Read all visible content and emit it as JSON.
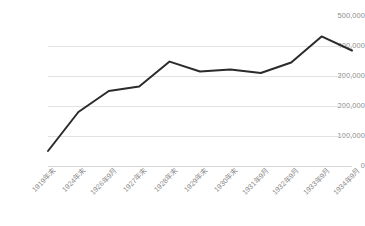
{
  "chart_data": {
    "type": "line",
    "title": "",
    "subtitle": "",
    "xlabel": "",
    "ylabel": "",
    "categories": [
      "1919年末",
      "1924年末",
      "1926年9月",
      "1927年末",
      "1928年末",
      "1929年末",
      "1930年末",
      "1931年9月",
      "1932年9月",
      "1933年9月",
      "1934年9月"
    ],
    "values": [
      50000,
      180000,
      250000,
      265000,
      348000,
      315000,
      322000,
      310000,
      345000,
      432000,
      385000
    ],
    "series": [
      {
        "name": "",
        "values": [
          50000,
          180000,
          250000,
          265000,
          348000,
          315000,
          322000,
          310000,
          345000,
          432000,
          385000
        ]
      }
    ],
    "ylim": [
      0,
      500000
    ],
    "yticks": [
      0,
      100000,
      200000,
      300000,
      400000,
      500000
    ],
    "ytick_labels": [
      "0",
      "100,000",
      "200,000",
      "300,000",
      "400,000",
      "500,000"
    ],
    "grid": true,
    "grid_axis": "y",
    "legend": false,
    "legend_position": "none",
    "line_color": "#2b2b2b",
    "grid_color": "#e2e2e2",
    "axis_color": "#d6d6d6",
    "tick_label_color": "#8c8c8c",
    "background_color": "#ffffff",
    "xlabel_rotation": -45,
    "markers": false
  }
}
